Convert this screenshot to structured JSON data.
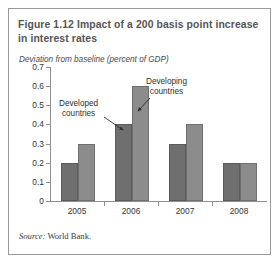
{
  "figure": {
    "title": "Figure 1.12  Impact of a 200 basis point increase in interest rates",
    "source_word": "Source:",
    "source_text": " World Bank."
  },
  "colors": {
    "developed_bar": "#6f6f6f",
    "developing_bar": "#8c8c8c",
    "axis": "#8f8f8f",
    "title_text": "#555555",
    "border": "#9a9a9a"
  },
  "chart_data": {
    "type": "bar",
    "title": "Figure 1.12  Impact of a 200 basis point increase in interest rates",
    "subtitle": "Deviation from baseline (percent of GDP)",
    "xlabel": "",
    "ylabel": "Deviation from baseline (percent of GDP)",
    "categories": [
      "2005",
      "2006",
      "2007",
      "2008"
    ],
    "series": [
      {
        "name": "Developed countries",
        "values": [
          0.2,
          0.4,
          0.3,
          0.2
        ]
      },
      {
        "name": "Developing countries",
        "values": [
          0.3,
          0.6,
          0.4,
          0.2
        ]
      }
    ],
    "ylim": [
      0,
      0.7
    ],
    "yticks": [
      "0",
      "0.1",
      "0.2",
      "0.3",
      "0.4",
      "0.5",
      "0.6",
      "0.7"
    ],
    "ytick_values": [
      0,
      0.1,
      0.2,
      0.3,
      0.4,
      0.5,
      0.6,
      0.7
    ],
    "grid": false,
    "legend": "none",
    "annotations": [
      {
        "text": "Developed\ncountries",
        "label_line1": "Developed",
        "label_line2": "countries",
        "points_to": "2006 developed bar"
      },
      {
        "text": "Developing\ncountries",
        "label_line1": "Developing",
        "label_line2": "countries",
        "points_to": "2006 developing bar"
      }
    ],
    "source": "Source: World Bank."
  }
}
